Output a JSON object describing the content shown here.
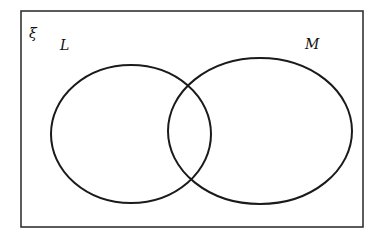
{
  "diagram": {
    "type": "venn",
    "universal_set_label": "ξ",
    "sets": [
      {
        "id": "L",
        "label": "L"
      },
      {
        "id": "M",
        "label": "M"
      }
    ],
    "colors": {
      "stroke": "#1a1a1a",
      "frame": "#333333",
      "background": "#ffffff"
    }
  }
}
